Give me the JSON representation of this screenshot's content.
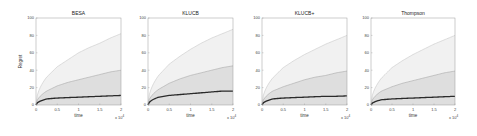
{
  "chart_data": [
    {
      "type": "area",
      "title": "BESA",
      "xlabel": "time",
      "ylabel": "Regret",
      "x_multiplier": "x 10^4",
      "xlim": [
        0,
        2
      ],
      "ylim": [
        0,
        100
      ],
      "xticks": [
        "0",
        "0.5",
        "1",
        "1.5",
        "2"
      ],
      "yticks": [
        "0",
        "20",
        "40",
        "60",
        "80",
        "100"
      ],
      "grid": false,
      "x": [
        0,
        0.25,
        0.5,
        0.75,
        1,
        1.25,
        1.5,
        1.75,
        2
      ],
      "series": [
        {
          "name": "mean",
          "values": [
            0,
            7,
            8,
            8.5,
            9,
            9.5,
            10,
            10.5,
            11
          ]
        },
        {
          "name": "upper quantile (inner)",
          "values": [
            0,
            16,
            22,
            26,
            29,
            32,
            35,
            38,
            40
          ]
        },
        {
          "name": "upper quantile (outer)",
          "values": [
            0,
            32,
            44,
            52,
            60,
            66,
            71,
            77,
            82
          ]
        }
      ]
    },
    {
      "type": "area",
      "title": "KLUCB",
      "xlabel": "time",
      "ylabel": "",
      "x_multiplier": "x 10^4",
      "xlim": [
        0,
        2
      ],
      "ylim": [
        0,
        100
      ],
      "xticks": [
        "0",
        "0.5",
        "1",
        "1.5",
        "2"
      ],
      "yticks": [
        "0",
        "20",
        "40",
        "60",
        "80",
        "100"
      ],
      "grid": false,
      "x": [
        0,
        0.25,
        0.5,
        0.75,
        1,
        1.25,
        1.5,
        1.75,
        2
      ],
      "series": [
        {
          "name": "mean",
          "values": [
            0,
            9,
            11,
            12,
            13,
            14,
            15,
            16,
            16
          ]
        },
        {
          "name": "upper quantile (inner)",
          "values": [
            0,
            18,
            25,
            30,
            34,
            37,
            40,
            43,
            45
          ]
        },
        {
          "name": "upper quantile (outer)",
          "values": [
            0,
            34,
            47,
            56,
            64,
            71,
            77,
            82,
            87
          ]
        }
      ]
    },
    {
      "type": "area",
      "title": "KLUCB+",
      "xlabel": "time",
      "ylabel": "",
      "x_multiplier": "x 10^4",
      "xlim": [
        0,
        2
      ],
      "ylim": [
        0,
        100
      ],
      "xticks": [
        "0",
        "0.5",
        "1",
        "1.5",
        "2"
      ],
      "yticks": [
        "0",
        "20",
        "40",
        "60",
        "80",
        "100"
      ],
      "grid": false,
      "x": [
        0,
        0.25,
        0.5,
        0.75,
        1,
        1.25,
        1.5,
        1.75,
        2
      ],
      "series": [
        {
          "name": "mean",
          "values": [
            0,
            7,
            8,
            8.5,
            9,
            9.5,
            10,
            10,
            10.5
          ]
        },
        {
          "name": "upper quantile (inner)",
          "values": [
            0,
            16,
            21,
            25,
            29,
            32,
            34,
            37,
            39
          ]
        },
        {
          "name": "upper quantile (outer)",
          "values": [
            0,
            31,
            43,
            51,
            58,
            64,
            70,
            75,
            80
          ]
        }
      ]
    },
    {
      "type": "area",
      "title": "Thompson",
      "xlabel": "time",
      "ylabel": "",
      "x_multiplier": "x 10^4",
      "xlim": [
        0,
        2
      ],
      "ylim": [
        0,
        100
      ],
      "xticks": [
        "0",
        "0.5",
        "1",
        "1.5",
        "2"
      ],
      "yticks": [
        "0",
        "20",
        "40",
        "60",
        "80",
        "100"
      ],
      "grid": false,
      "x": [
        0,
        0.25,
        0.5,
        0.75,
        1,
        1.25,
        1.5,
        1.75,
        2
      ],
      "series": [
        {
          "name": "mean",
          "values": [
            0,
            6,
            7,
            7.5,
            8,
            8.5,
            9,
            9.5,
            10
          ]
        },
        {
          "name": "upper quantile (inner)",
          "values": [
            0,
            16,
            21,
            25,
            28,
            31,
            34,
            37,
            39
          ]
        },
        {
          "name": "upper quantile (outer)",
          "values": [
            0,
            31,
            43,
            51,
            58,
            64,
            70,
            75,
            80
          ]
        }
      ]
    }
  ],
  "colors": {
    "outer_band": "#f1f1f1",
    "inner_band": "#dedede",
    "outer_line": "#c8c8c8",
    "inner_line": "#a8a8a8",
    "mean_line": "#2a2a2a",
    "axes": "#9a9a9a"
  }
}
